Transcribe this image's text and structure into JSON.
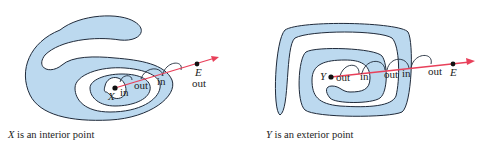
{
  "colors": {
    "region_fill": "#bcd9ef",
    "outline": "#1f2a3a",
    "ray": "#e8405a",
    "point": "#111111",
    "background": "#ffffff"
  },
  "left_figure": {
    "point_label": "X",
    "end_label": "E",
    "end_status": "out",
    "crossing_labels": [
      "in",
      "out",
      "in"
    ],
    "caption_point": "X",
    "caption_text": " is an interior point"
  },
  "right_figure": {
    "point_label": "Y",
    "end_label": "E",
    "crossing_labels": [
      "out",
      "in",
      "out",
      "in",
      "out"
    ],
    "caption_point": "Y",
    "caption_text": " is an exterior point"
  }
}
